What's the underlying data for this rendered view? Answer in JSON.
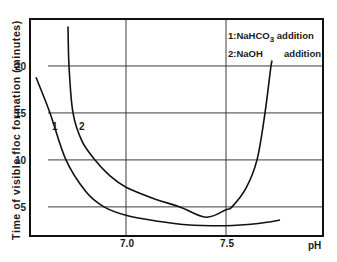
{
  "chart_data": {
    "type": "line",
    "title": "",
    "xlabel": "pH",
    "ylabel": "Time of visible floc formation (minutes)",
    "xlim": [
      6.52,
      7.985
    ],
    "ylim": [
      1.9,
      25
    ],
    "x_ticks": [
      "7.0",
      "7.5"
    ],
    "y_ticks": [
      "5",
      "10",
      "15",
      "20"
    ],
    "grid": true,
    "legend": {
      "position": "upper right",
      "entries": [
        "1:NaHCO3 addition",
        "2:NaOH addition"
      ]
    },
    "series": [
      {
        "name": "1: NaHCO3 addition",
        "label": "1",
        "x": [
          6.55,
          6.62,
          6.7,
          6.8,
          6.89,
          7.0,
          7.15,
          7.3,
          7.5,
          7.65,
          7.77
        ],
        "y": [
          18.8,
          15.0,
          10.0,
          6.6,
          5.0,
          4.1,
          3.5,
          3.1,
          3.0,
          3.2,
          3.6
        ]
      },
      {
        "name": "2: NaOH addition",
        "label": "2",
        "x": [
          6.71,
          6.715,
          6.735,
          6.78,
          6.845,
          6.92,
          7.0,
          7.15,
          7.27,
          7.4,
          7.5,
          7.53,
          7.6,
          7.655,
          7.695,
          7.725,
          7.73
        ],
        "y": [
          24.2,
          20.0,
          15.0,
          12.0,
          10.0,
          8.3,
          7.1,
          5.8,
          5.0,
          3.9,
          4.7,
          5.0,
          7.0,
          10.0,
          15.0,
          20.0,
          20.4
        ]
      }
    ]
  },
  "labels": {
    "ylabel": "Time of visible floc formation (minutes)",
    "xlabel": "pH",
    "yticks": [
      "20",
      "15",
      "10",
      "5"
    ],
    "xticks": [
      "7.0",
      "7.5"
    ],
    "legend1_prefix": "1:NaHCO",
    "legend1_sub": "3",
    "legend1_suffix": " addition",
    "legend2_prefix": "2:NaOH",
    "legend2_suffix": "addition",
    "curve1": "1",
    "curve2": "2"
  }
}
